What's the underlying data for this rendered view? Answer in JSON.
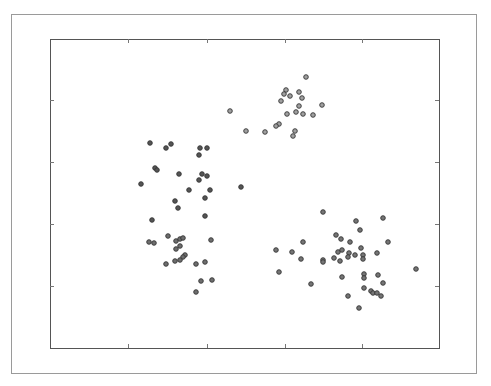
{
  "chart_data": {
    "type": "scatter",
    "title": "",
    "xlabel": "",
    "ylabel": "",
    "grid": false,
    "legend": null,
    "tick_labels_visible": false,
    "plot_area_px": {
      "left": 50,
      "top": 39,
      "right": 439,
      "bottom": 348
    },
    "x_ticks_px": [
      128,
      207,
      285,
      362
    ],
    "y_ticks_px": [
      100,
      162,
      224,
      286
    ],
    "series": [
      {
        "name": "cluster-upper-left",
        "color": "#555555",
        "points_px": [
          [
            150,
            143
          ],
          [
            166,
            148
          ],
          [
            171,
            144
          ],
          [
            200,
            148
          ],
          [
            207,
            148
          ],
          [
            199,
            155
          ],
          [
            155,
            168
          ],
          [
            157,
            170
          ],
          [
            179,
            174
          ],
          [
            202,
            174
          ],
          [
            207,
            176
          ],
          [
            199,
            180
          ],
          [
            141,
            184
          ],
          [
            189,
            190
          ],
          [
            210,
            190
          ],
          [
            205,
            198
          ],
          [
            175,
            201
          ],
          [
            178,
            208
          ],
          [
            205,
            216
          ],
          [
            152,
            220
          ],
          [
            241,
            187
          ]
        ]
      },
      {
        "name": "cluster-top",
        "color": "#a0a0a0",
        "points_px": [
          [
            306,
            77
          ],
          [
            286,
            90
          ],
          [
            284,
            94
          ],
          [
            290,
            96
          ],
          [
            299,
            92
          ],
          [
            302,
            98
          ],
          [
            281,
            101
          ],
          [
            299,
            106
          ],
          [
            322,
            105
          ],
          [
            287,
            114
          ],
          [
            296,
            112
          ],
          [
            303,
            114
          ],
          [
            313,
            115
          ],
          [
            230,
            111
          ],
          [
            279,
            124
          ],
          [
            276,
            126
          ],
          [
            246,
            131
          ],
          [
            265,
            132
          ],
          [
            295,
            131
          ],
          [
            293,
            136
          ]
        ]
      },
      {
        "name": "cluster-lower-left",
        "color": "#6e6e6e",
        "points_px": [
          [
            168,
            236
          ],
          [
            149,
            242
          ],
          [
            154,
            243
          ],
          [
            176,
            241
          ],
          [
            180,
            239
          ],
          [
            183,
            238
          ],
          [
            211,
            240
          ],
          [
            180,
            246
          ],
          [
            176,
            249
          ],
          [
            185,
            255
          ],
          [
            183,
            257
          ],
          [
            180,
            260
          ],
          [
            175,
            261
          ],
          [
            166,
            264
          ],
          [
            196,
            264
          ],
          [
            205,
            262
          ],
          [
            201,
            281
          ],
          [
            212,
            280
          ],
          [
            196,
            292
          ]
        ]
      },
      {
        "name": "cluster-right",
        "color": "#757575",
        "points_px": [
          [
            323,
            212
          ],
          [
            356,
            221
          ],
          [
            383,
            218
          ],
          [
            360,
            230
          ],
          [
            336,
            235
          ],
          [
            341,
            239
          ],
          [
            350,
            242
          ],
          [
            303,
            242
          ],
          [
            388,
            242
          ],
          [
            276,
            250
          ],
          [
            292,
            252
          ],
          [
            338,
            252
          ],
          [
            342,
            250
          ],
          [
            361,
            248
          ],
          [
            349,
            253
          ],
          [
            355,
            255
          ],
          [
            363,
            255
          ],
          [
            377,
            253
          ],
          [
            348,
            257
          ],
          [
            334,
            258
          ],
          [
            363,
            259
          ],
          [
            301,
            259
          ],
          [
            323,
            260
          ],
          [
            323,
            262
          ],
          [
            340,
            261
          ],
          [
            416,
            269
          ],
          [
            279,
            272
          ],
          [
            364,
            274
          ],
          [
            364,
            278
          ],
          [
            378,
            275
          ],
          [
            342,
            277
          ],
          [
            383,
            283
          ],
          [
            311,
            284
          ],
          [
            364,
            288
          ],
          [
            371,
            291
          ],
          [
            373,
            293
          ],
          [
            377,
            293
          ],
          [
            381,
            296
          ],
          [
            348,
            296
          ],
          [
            359,
            308
          ]
        ]
      }
    ]
  }
}
